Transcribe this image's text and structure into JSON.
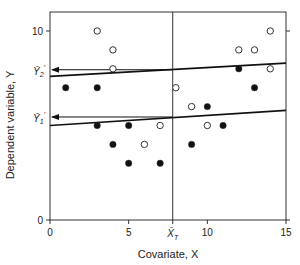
{
  "chart_data": {
    "type": "scatter",
    "title": "",
    "xlabel": "Covariate, X",
    "ylabel": "Dependent variable, Y",
    "xlim": [
      0,
      15
    ],
    "ylim": [
      0,
      11
    ],
    "xticks": [
      0,
      5,
      10,
      15
    ],
    "yticks": [
      0,
      10
    ],
    "grid": false,
    "legend": null,
    "series": [
      {
        "name": "Group 1 (filled)",
        "marker": "filled-circle",
        "points": [
          [
            1,
            7
          ],
          [
            3,
            7
          ],
          [
            3,
            5
          ],
          [
            4,
            4
          ],
          [
            5,
            5
          ],
          [
            5,
            3
          ],
          [
            7,
            3
          ],
          [
            9,
            4
          ],
          [
            10,
            6
          ],
          [
            11,
            5
          ],
          [
            12,
            8
          ],
          [
            13,
            7
          ]
        ]
      },
      {
        "name": "Group 2 (open)",
        "marker": "open-circle",
        "points": [
          [
            3,
            10
          ],
          [
            4,
            9
          ],
          [
            4,
            8
          ],
          [
            6,
            4
          ],
          [
            7,
            5
          ],
          [
            8,
            7
          ],
          [
            9,
            6
          ],
          [
            10,
            5
          ],
          [
            12,
            9
          ],
          [
            13,
            9
          ],
          [
            14,
            10
          ],
          [
            14,
            8
          ]
        ]
      }
    ],
    "regression_lines": [
      {
        "name": "Group 2 line",
        "from": [
          0,
          7.6
        ],
        "to": [
          15,
          8.3
        ]
      },
      {
        "name": "Group 1 line",
        "from": [
          0,
          5.0
        ],
        "to": [
          15,
          5.8
        ]
      }
    ],
    "annotations": {
      "xbar_T": {
        "label": "X̄",
        "subscript": "T",
        "x": 7.8
      },
      "adjusted_means": [
        {
          "label": "Ȳ",
          "subscript": "2",
          "prime": "′",
          "y": 7.95
        },
        {
          "label": "Ȳ",
          "subscript": "1",
          "prime": "′",
          "y": 5.45
        }
      ]
    }
  }
}
